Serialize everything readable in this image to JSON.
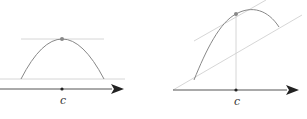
{
  "diagrams": [
    {
      "name": "horizontal-tangent-at-maximum",
      "point_label": "c",
      "colors": {
        "axis": "#555555",
        "curve": "#888888",
        "guide": "#c8c8c8",
        "point": "#888888",
        "dot": "#222222"
      }
    },
    {
      "name": "parallel-tangent-mean-value",
      "point_label": "c",
      "colors": {
        "axis": "#555555",
        "curve": "#888888",
        "guide": "#c8c8c8",
        "point": "#888888",
        "dot": "#222222"
      }
    }
  ]
}
